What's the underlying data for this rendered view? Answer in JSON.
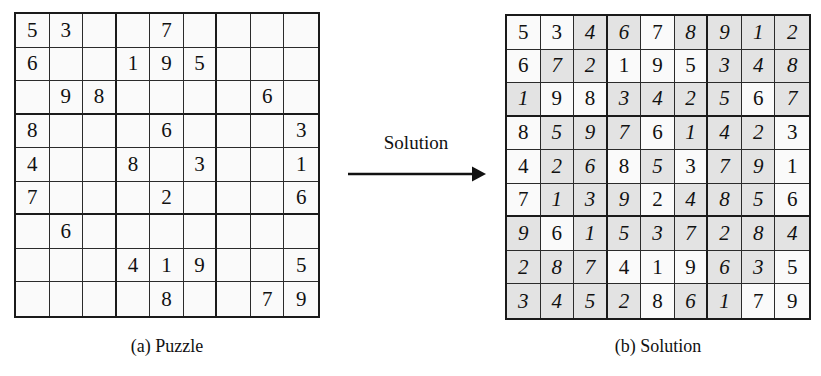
{
  "figure": {
    "type": "sudoku-puzzle-and-solution",
    "background_color": "#ffffff",
    "grid_line_color": "#1a1a1a",
    "given_cell_color": "#fafafa",
    "solved_cell_color": "#e3e3e3",
    "text_color": "#111111"
  },
  "arrow": {
    "label": "Solution",
    "direction": "right"
  },
  "captions": {
    "puzzle": "(a) Puzzle",
    "solution": "(b) Solution"
  },
  "puzzle": {
    "caption": "(a) Puzzle",
    "rows": [
      [
        "5",
        "3",
        "",
        "",
        "7",
        "",
        "",
        "",
        ""
      ],
      [
        "6",
        "",
        "",
        "1",
        "9",
        "5",
        "",
        "",
        ""
      ],
      [
        "",
        "9",
        "8",
        "",
        "",
        "",
        "",
        "6",
        ""
      ],
      [
        "8",
        "",
        "",
        "",
        "6",
        "",
        "",
        "",
        "3"
      ],
      [
        "4",
        "",
        "",
        "8",
        "",
        "3",
        "",
        "",
        "1"
      ],
      [
        "7",
        "",
        "",
        "",
        "2",
        "",
        "",
        "",
        "6"
      ],
      [
        "",
        "6",
        "",
        "",
        "",
        "",
        "",
        "",
        ""
      ],
      [
        "",
        "",
        "",
        "4",
        "1",
        "9",
        "",
        "",
        "5"
      ],
      [
        "",
        "",
        "",
        "",
        "8",
        "",
        "",
        "7",
        "9"
      ]
    ]
  },
  "solution": {
    "caption": "(b) Solution",
    "rows": [
      [
        "5",
        "3",
        "4",
        "6",
        "7",
        "8",
        "9",
        "1",
        "2"
      ],
      [
        "6",
        "7",
        "2",
        "1",
        "9",
        "5",
        "3",
        "4",
        "8"
      ],
      [
        "1",
        "9",
        "8",
        "3",
        "4",
        "2",
        "5",
        "6",
        "7"
      ],
      [
        "8",
        "5",
        "9",
        "7",
        "6",
        "1",
        "4",
        "2",
        "3"
      ],
      [
        "4",
        "2",
        "6",
        "8",
        "5",
        "3",
        "7",
        "9",
        "1"
      ],
      [
        "7",
        "1",
        "3",
        "9",
        "2",
        "4",
        "8",
        "5",
        "6"
      ],
      [
        "9",
        "6",
        "1",
        "5",
        "3",
        "7",
        "2",
        "8",
        "4"
      ],
      [
        "2",
        "8",
        "7",
        "4",
        "1",
        "9",
        "6",
        "3",
        "5"
      ],
      [
        "3",
        "4",
        "5",
        "2",
        "8",
        "6",
        "1",
        "7",
        "9"
      ]
    ],
    "given_mask": [
      [
        true,
        true,
        false,
        false,
        true,
        false,
        false,
        false,
        false
      ],
      [
        true,
        false,
        false,
        true,
        true,
        true,
        false,
        false,
        false
      ],
      [
        false,
        true,
        true,
        false,
        false,
        false,
        false,
        true,
        false
      ],
      [
        true,
        false,
        false,
        false,
        true,
        false,
        false,
        false,
        true
      ],
      [
        true,
        false,
        false,
        true,
        false,
        true,
        false,
        false,
        true
      ],
      [
        true,
        false,
        false,
        false,
        true,
        false,
        false,
        false,
        true
      ],
      [
        false,
        true,
        false,
        false,
        false,
        false,
        false,
        false,
        false
      ],
      [
        false,
        false,
        false,
        true,
        true,
        true,
        false,
        false,
        true
      ],
      [
        false,
        false,
        false,
        false,
        true,
        false,
        false,
        true,
        true
      ]
    ]
  }
}
